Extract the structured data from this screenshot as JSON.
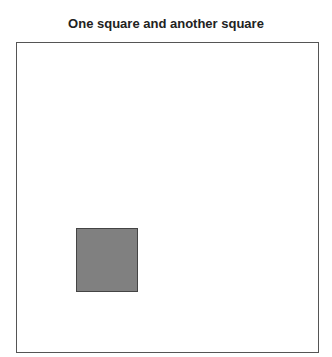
{
  "chart_data": {
    "type": "shapes",
    "title": "One square and another square",
    "xlabel": "",
    "ylabel": "",
    "grid": false,
    "legend": null,
    "shapes": [
      {
        "name": "square",
        "fill": "#808080",
        "stroke": "#444444",
        "x_px": 76,
        "y_px": 228,
        "w_px": 62,
        "h_px": 64
      }
    ]
  }
}
